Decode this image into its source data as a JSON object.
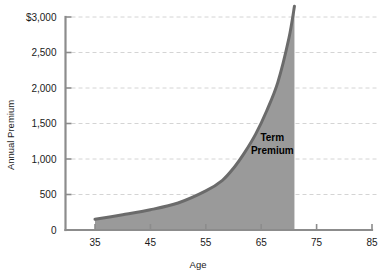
{
  "chart_data": {
    "type": "area",
    "title": "",
    "xlabel": "Age",
    "ylabel": "Annual Premium",
    "x": [
      35,
      40,
      45,
      50,
      55,
      58,
      60,
      62,
      64,
      66,
      68,
      70,
      71
    ],
    "values": [
      150,
      215,
      285,
      380,
      550,
      700,
      870,
      1090,
      1350,
      1680,
      2080,
      2700,
      3150
    ],
    "xlim": [
      30,
      85
    ],
    "ylim": [
      0,
      3000
    ],
    "xticks": [
      35,
      45,
      55,
      65,
      75,
      85
    ],
    "xtick_labels": [
      "35",
      "45",
      "55",
      "65",
      "75",
      "85"
    ],
    "yticks": [
      0,
      500,
      1000,
      1500,
      2000,
      2500,
      3000
    ],
    "ytick_labels": [
      "0",
      "500",
      "1,000",
      "1,500",
      "2,000",
      "2,500",
      "$3,000"
    ],
    "grid": "horizontal-dashed",
    "legend": "none",
    "series": [
      {
        "name": "Term Premium",
        "values": [
          150,
          215,
          285,
          380,
          550,
          700,
          870,
          1090,
          1350,
          1680,
          2080,
          2700,
          3150
        ]
      }
    ],
    "annotations": [
      {
        "name": "term-premium-label",
        "line1": "Term",
        "line2": "Premium",
        "x": 67,
        "y": 1250
      }
    ],
    "colors": {
      "fill": "#9a9a9a",
      "stroke": "#6b6b6b",
      "grid": "#c9c9c9",
      "axis": "#8c8c8c",
      "text": "#1a1a1a"
    }
  }
}
